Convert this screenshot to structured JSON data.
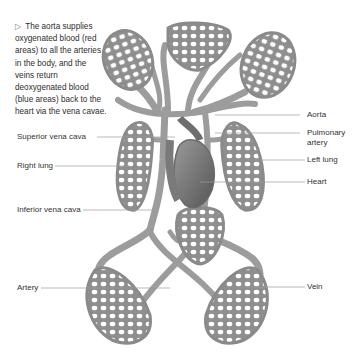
{
  "caption": {
    "marker": "▷",
    "text": "The aorta supplies oxygenated blood (red areas) to all the arteries in the body, and the veins return deoxygenated blood (blue areas) back to the heart via the vena cavae."
  },
  "labels": {
    "left": [
      {
        "id": "superior-vena-cava",
        "text": "Superior vena cava"
      },
      {
        "id": "right-lung",
        "text": "Right lung"
      },
      {
        "id": "inferior-vena-cava",
        "text": "Inferior vena cava"
      },
      {
        "id": "artery",
        "text": "Artery"
      }
    ],
    "right": [
      {
        "id": "aorta",
        "text": "Aorta"
      },
      {
        "id": "pulmonary-artery-line1",
        "text": "Pulmonary"
      },
      {
        "id": "pulmonary-artery-line2",
        "text": "artery"
      },
      {
        "id": "left-lung",
        "text": "Left lung"
      },
      {
        "id": "heart",
        "text": "Heart"
      },
      {
        "id": "vein",
        "text": "Vein"
      }
    ]
  },
  "colors": {
    "vessel": "#9a9a9a",
    "vessel_dark": "#6e6e6e",
    "leader_line": "#9b9b9b",
    "text": "#333333"
  }
}
